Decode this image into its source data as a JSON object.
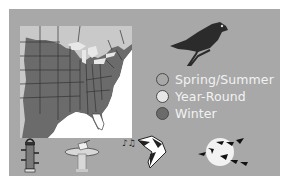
{
  "colors": {
    "panel": "#a8a8a8",
    "map_range": "#6b6b6b",
    "map_north": "#c9c9c9",
    "bird": "#2b2b2b"
  },
  "legend": {
    "items": [
      {
        "label": "Spring/Summer",
        "fill": "#a8a8a8",
        "stroke": "#4a4a4a"
      },
      {
        "label": "Year-Round",
        "fill": "#e6e6e6",
        "stroke": "#4a4a4a"
      },
      {
        "label": "Winter",
        "fill": "#6b6b6b",
        "stroke": "#4a4a4a"
      }
    ]
  },
  "icons": {
    "bird": "bird-silhouette-icon",
    "feeder": "tube-feeder-icon",
    "birdbath": "birdbath-icon",
    "song": "singing-bird-icon",
    "migration": "migration-flock-icon"
  }
}
